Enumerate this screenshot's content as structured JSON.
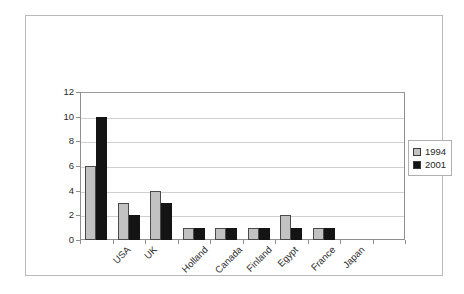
{
  "chart_data": {
    "type": "bar",
    "title": "",
    "subtitle": "",
    "xlabel": "",
    "ylabel": "",
    "categories": [
      "USA",
      "UK",
      "Holland",
      "Canada",
      "Finland",
      "Egypt",
      "France",
      "Japan"
    ],
    "series": [
      {
        "name": "1994",
        "color": "#c2c2c2",
        "values": [
          6,
          3,
          4,
          1,
          1,
          1,
          2,
          1
        ]
      },
      {
        "name": "2001",
        "color": "#141414",
        "values": [
          10,
          2,
          3,
          1,
          1,
          1,
          1,
          1
        ]
      }
    ],
    "ylim": [
      0,
      12
    ],
    "yticks": [
      0,
      2,
      4,
      6,
      8,
      10,
      12
    ],
    "ytick_labels": [
      "0",
      "2",
      "4",
      "6",
      "8",
      "10",
      "12"
    ],
    "grid": "horizontal",
    "legend_position": "right",
    "legend_entries": [
      "1994",
      "2001"
    ],
    "xtick_label_rotation": -45,
    "plot_category_slots": 10
  }
}
